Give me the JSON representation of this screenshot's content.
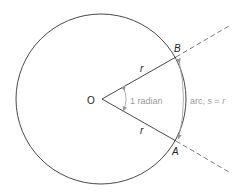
{
  "diagram": {
    "labels": {
      "center": "O",
      "point_b": "B",
      "point_a": "A",
      "radius_top": "r",
      "radius_bottom": "r",
      "angle": "1 radian",
      "arc_prefix": "arc, ",
      "arc_s": "s",
      "arc_eq": " = ",
      "arc_r": "r"
    },
    "colors": {
      "line": "#333333",
      "annotation": "#9a9a9a",
      "background": "#ffffff"
    }
  }
}
